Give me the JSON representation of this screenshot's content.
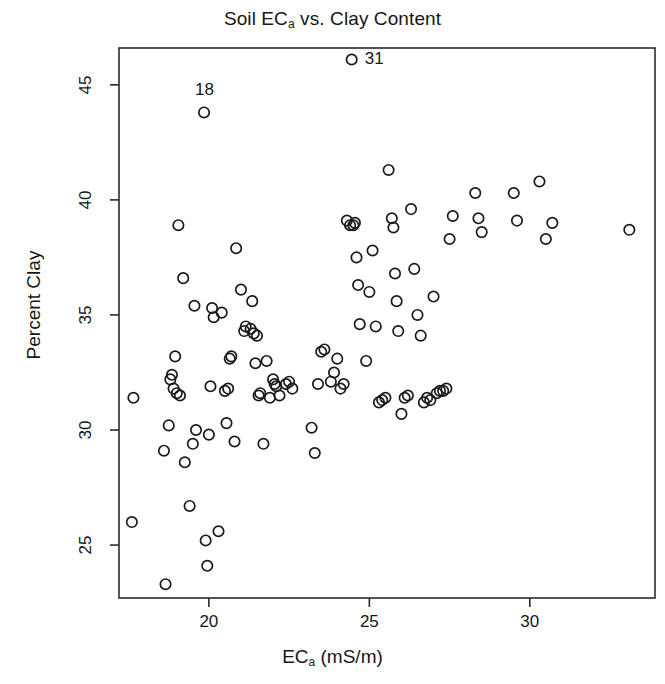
{
  "chart_data": {
    "type": "scatter",
    "title": "Soil ECa vs. Clay Content",
    "title_main": "Soil EC",
    "title_sub": "a",
    "title_rest": " vs. Clay Content",
    "xlabel": "ECa (mS/m)",
    "xlabel_main": "EC",
    "xlabel_sub": "a",
    "xlabel_rest": " (mS/m)",
    "ylabel": "Percent Clay",
    "xlim": [
      17.2,
      33.9
    ],
    "ylim": [
      22.7,
      46.6
    ],
    "xticks": [
      20,
      25,
      30
    ],
    "yticks": [
      25,
      30,
      35,
      40,
      45
    ],
    "xtick_labels": [
      "20",
      "25",
      "30"
    ],
    "ytick_labels": [
      "25",
      "30",
      "35",
      "40",
      "45"
    ],
    "grid": false,
    "legend": "none",
    "marker": "open-circle",
    "marker_color": "#1a1a1a",
    "x": [
      17.65,
      17.6,
      18.6,
      18.65,
      18.75,
      18.8,
      18.85,
      18.9,
      18.95,
      19.0,
      19.05,
      19.1,
      19.2,
      19.25,
      19.4,
      19.5,
      19.55,
      19.6,
      19.85,
      19.9,
      19.95,
      20.0,
      20.05,
      20.1,
      20.15,
      20.3,
      20.4,
      20.5,
      20.55,
      20.6,
      20.65,
      20.7,
      20.8,
      20.85,
      21.0,
      21.1,
      21.15,
      21.3,
      21.35,
      21.4,
      21.45,
      21.5,
      21.55,
      21.6,
      21.7,
      21.8,
      21.9,
      22.0,
      22.05,
      22.1,
      22.2,
      22.4,
      22.5,
      22.6,
      23.2,
      23.3,
      23.4,
      23.5,
      23.6,
      23.8,
      23.9,
      24.0,
      24.1,
      24.2,
      24.3,
      24.4,
      24.45,
      24.5,
      24.55,
      24.6,
      24.65,
      24.7,
      24.9,
      25.0,
      25.1,
      25.2,
      25.3,
      25.4,
      25.5,
      25.6,
      25.7,
      25.75,
      25.8,
      25.85,
      25.9,
      26.0,
      26.1,
      26.2,
      26.3,
      26.4,
      26.5,
      26.6,
      26.7,
      26.8,
      26.9,
      27.0,
      27.1,
      27.2,
      27.3,
      27.4,
      27.5,
      27.6,
      28.3,
      28.4,
      28.5,
      29.5,
      29.6,
      30.3,
      30.5,
      30.7,
      33.1
    ],
    "y": [
      31.4,
      26.0,
      29.1,
      23.3,
      30.2,
      32.2,
      32.4,
      31.8,
      33.2,
      31.6,
      38.9,
      31.5,
      36.6,
      28.6,
      26.7,
      29.4,
      35.4,
      30.0,
      43.8,
      25.2,
      24.1,
      29.8,
      31.9,
      35.3,
      34.9,
      25.6,
      35.1,
      31.7,
      30.3,
      31.8,
      33.1,
      33.2,
      29.5,
      37.9,
      36.1,
      34.3,
      34.5,
      34.4,
      35.6,
      34.2,
      32.9,
      34.1,
      31.5,
      31.6,
      29.4,
      33.0,
      31.4,
      32.2,
      32.0,
      31.9,
      31.5,
      32.0,
      32.1,
      31.8,
      30.1,
      29.0,
      32.0,
      33.4,
      33.5,
      32.1,
      32.5,
      33.1,
      31.8,
      32.0,
      39.1,
      38.9,
      46.1,
      38.9,
      39.0,
      37.5,
      36.3,
      34.6,
      33.0,
      36.0,
      37.8,
      34.5,
      31.2,
      31.3,
      31.4,
      41.3,
      39.2,
      38.8,
      36.8,
      35.6,
      34.3,
      30.7,
      31.4,
      31.5,
      39.6,
      37.0,
      35.0,
      34.1,
      31.2,
      31.4,
      31.3,
      35.8,
      31.6,
      31.7,
      31.7,
      31.8,
      38.3,
      39.3,
      40.3,
      39.2,
      38.6,
      40.3,
      39.1,
      40.8,
      38.3,
      39.0,
      38.7
    ],
    "annotations": [
      {
        "label": "31",
        "x": 24.45,
        "y": 46.1,
        "position": "right"
      },
      {
        "label": "18",
        "x": 19.85,
        "y": 43.8,
        "position": "above"
      }
    ]
  }
}
